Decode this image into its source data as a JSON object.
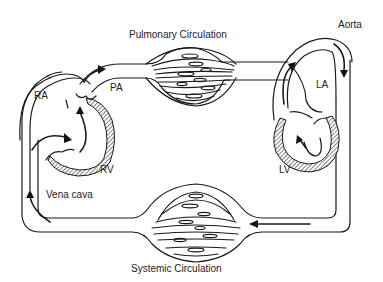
{
  "diagram": {
    "title_top": "Pulmonary Circulation",
    "title_bottom": "Systemic Circulation",
    "labels": {
      "ra": "RA",
      "rv": "RV",
      "pa": "PA",
      "la": "LA",
      "lv": "LV",
      "aorta": "Aorta",
      "vena_cava": "Vena cava"
    },
    "colors": {
      "line": "#1a1a1a",
      "background": "#ffffff",
      "text": "#222222"
    },
    "flow": [
      "Vena cava",
      "RA",
      "RV",
      "PA",
      "Pulmonary Circulation",
      "LA",
      "LV",
      "Aorta",
      "Systemic Circulation",
      "Vena cava"
    ]
  }
}
